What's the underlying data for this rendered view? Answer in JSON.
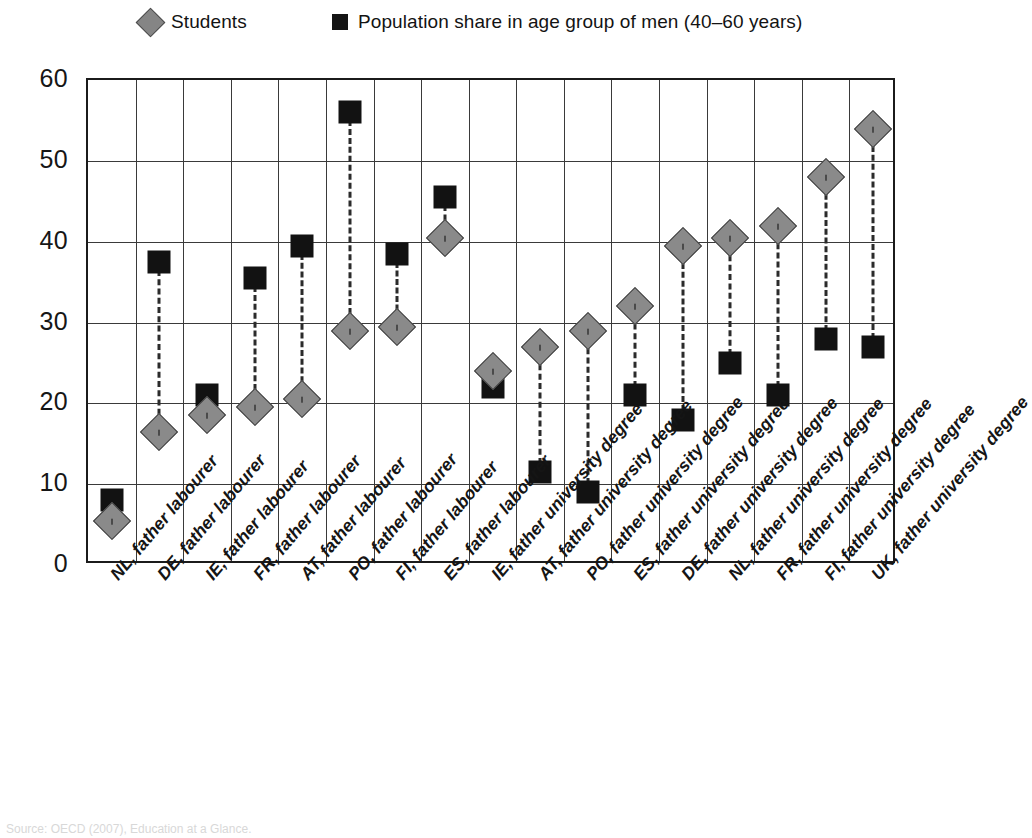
{
  "legend": {
    "students": {
      "label": "Students",
      "marker": "diamond-marker-icon",
      "color": "#8a8a8a"
    },
    "population": {
      "label": "Population share in age group of men (40–60 years)",
      "marker": "square-marker-icon",
      "color": "#121212"
    }
  },
  "axis": {
    "y_ticks": [
      "60",
      "50",
      "40",
      "30",
      "20",
      "10",
      "0"
    ]
  },
  "source_note": "Source: OECD (2007), Education at a Glance.",
  "chart_data": {
    "type": "scatter",
    "title": "",
    "xlabel": "",
    "ylabel": "",
    "ylim": [
      0,
      60
    ],
    "ytick_step": 10,
    "grid": true,
    "legend_position": "top",
    "categories": [
      "NL, father labourer",
      "DE, father labourer",
      "IE, father labourer",
      "FR, father labourer",
      "AT, father labourer",
      "PO, father labourer",
      "FI, father labourer",
      "ES, father labourer",
      "IE, father university degree",
      "AT, father university degree",
      "PO, father university degree",
      "ES, father university degree",
      "DE, father university degree",
      "NL, father university degree",
      "FR, father university degree",
      "FI, father university degree",
      "UK, father university degree"
    ],
    "series": [
      {
        "name": "Students",
        "marker": "diamond",
        "color": "#8a8a8a",
        "values": [
          5.5,
          16.5,
          18.5,
          19.5,
          20.5,
          29.0,
          29.5,
          40.5,
          24.0,
          27.0,
          29.0,
          32.0,
          39.5,
          40.5,
          42.0,
          48.0,
          54.0
        ]
      },
      {
        "name": "Population share in age group of men (40–60 years)",
        "marker": "square",
        "color": "#121212",
        "values": [
          8.0,
          37.5,
          21.0,
          35.5,
          39.5,
          56.0,
          38.5,
          45.5,
          22.0,
          11.5,
          9.0,
          21.0,
          18.0,
          25.0,
          21.0,
          28.0,
          27.0
        ]
      }
    ]
  }
}
